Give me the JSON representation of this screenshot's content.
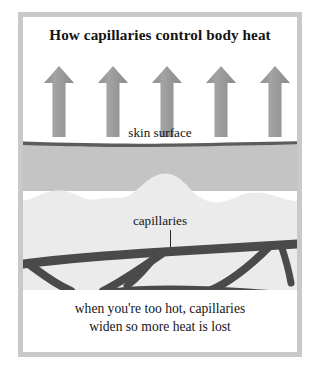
{
  "figure": {
    "title": "How capillaries control body heat",
    "labels": {
      "skin_surface": "skin surface",
      "capillaries": "capillaries"
    },
    "caption": {
      "line1": "when you're too hot, capillaries",
      "line2": "widen so more heat is lost"
    },
    "heat_arrows": {
      "count": 5,
      "direction": "up",
      "meaning": "heat radiating out of the skin"
    },
    "layers": [
      {
        "name": "air-above-skin",
        "color": "#ffffff"
      },
      {
        "name": "skin-surface-line",
        "color": "#595959"
      },
      {
        "name": "dermis",
        "color": "#c4c4c4"
      },
      {
        "name": "subcutaneous-tissue",
        "color": "#ebebeb"
      }
    ],
    "colors": {
      "frame": "#c9c9c9",
      "arrow": "#969696",
      "arrow_shadow": "#7f7f7f",
      "vessel": "#4a4a4a",
      "text": "#141414",
      "background": "#ffffff"
    }
  }
}
